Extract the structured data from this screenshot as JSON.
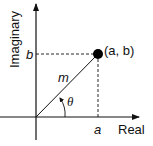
{
  "diagram": {
    "axes": {
      "x_label": "Real",
      "y_label": "Imaginary"
    },
    "point": {
      "label": "(a, b)"
    },
    "ticks": {
      "x": "a",
      "y": "b"
    },
    "magnitude_label": "m",
    "angle_label": "θ",
    "colors": {
      "stroke": "#111111",
      "point": "#000000"
    }
  }
}
